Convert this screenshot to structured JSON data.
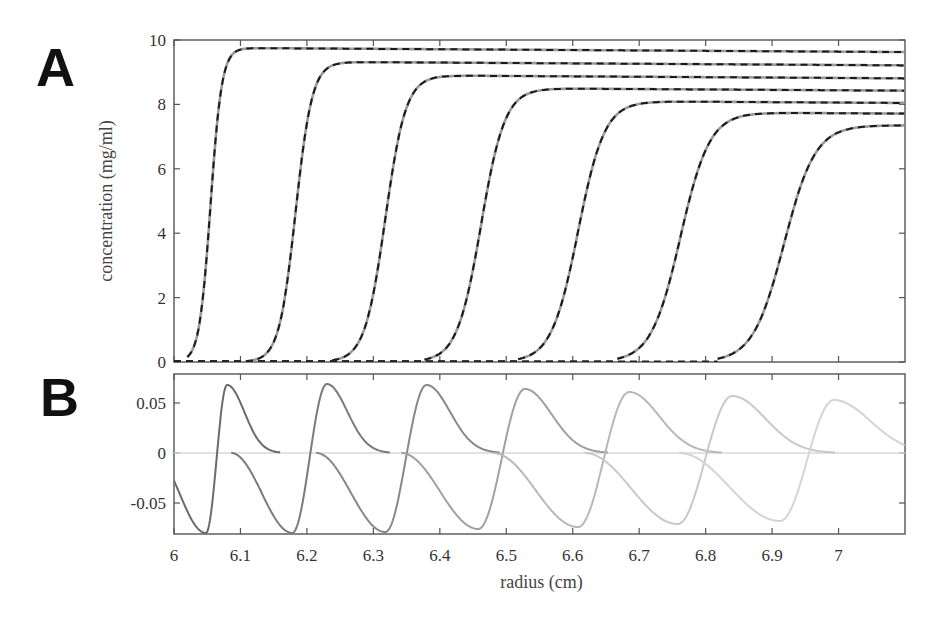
{
  "panels": {
    "A": {
      "letter": "A"
    },
    "B": {
      "letter": "B"
    }
  },
  "chart_data": [
    {
      "id": "A",
      "type": "line",
      "title": "",
      "xlabel": "",
      "ylabel": "concentration (mg/ml)",
      "xlim": [
        6.0,
        7.1
      ],
      "ylim": [
        0,
        10
      ],
      "yticks": [
        0,
        2,
        4,
        6,
        8,
        10
      ],
      "ytick_labels": [
        "0",
        "2",
        "4",
        "6",
        "8",
        "10"
      ],
      "xticks": [
        6.0,
        6.1,
        6.2,
        6.3,
        6.4,
        6.5,
        6.6,
        6.7,
        6.8,
        6.9,
        7.0
      ],
      "grid": false,
      "legend": null,
      "description": "Sedimentation boundary profiles at successive times; solid grey = data, dashed black = fit",
      "series": [
        {
          "name": "scan 1",
          "midpoint": 6.055,
          "width": 0.0085,
          "plateau": 9.75,
          "plateau_slope": -0.05,
          "style": "solid+dashed"
        },
        {
          "name": "scan 2",
          "midpoint": 6.183,
          "width": 0.0125,
          "plateau": 9.32,
          "plateau_slope": -0.05,
          "style": "solid+dashed"
        },
        {
          "name": "scan 3",
          "midpoint": 6.318,
          "width": 0.0155,
          "plateau": 8.9,
          "plateau_slope": -0.05,
          "style": "solid+dashed"
        },
        {
          "name": "scan 4",
          "midpoint": 6.462,
          "width": 0.018,
          "plateau": 8.5,
          "plateau_slope": -0.05,
          "style": "solid+dashed"
        },
        {
          "name": "scan 5",
          "midpoint": 6.608,
          "width": 0.02,
          "plateau": 8.1,
          "plateau_slope": -0.05,
          "style": "solid+dashed"
        },
        {
          "name": "scan 6",
          "midpoint": 6.762,
          "width": 0.022,
          "plateau": 7.75,
          "plateau_slope": -0.05,
          "style": "solid+dashed"
        },
        {
          "name": "scan 7",
          "midpoint": 6.918,
          "width": 0.0235,
          "plateau": 7.35,
          "plateau_slope": 0.0,
          "style": "solid+dashed"
        }
      ]
    },
    {
      "id": "B",
      "type": "line",
      "title": "",
      "xlabel": "radius (cm)",
      "ylabel": "",
      "xlim": [
        6.0,
        7.1
      ],
      "ylim": [
        -0.081,
        0.079
      ],
      "yticks": [
        -0.05,
        0,
        0.05
      ],
      "ytick_labels": [
        "-0.05",
        "0",
        "0.05"
      ],
      "xticks": [
        6.0,
        6.1,
        6.2,
        6.3,
        6.4,
        6.5,
        6.6,
        6.7,
        6.8,
        6.9,
        7.0
      ],
      "xtick_labels": [
        "6",
        "6.1",
        "6.2",
        "6.3",
        "6.4",
        "6.5",
        "6.6",
        "6.7",
        "6.8",
        "6.9",
        "7"
      ],
      "grid": false,
      "legend": null,
      "description": "Residuals of the fit for each scan (progressively lighter grey), oscillating about zero",
      "series": [
        {
          "name": "residual 1",
          "trough_x": 6.048,
          "trough_y": -0.08,
          "peak_x": 6.08,
          "peak_y": 0.068,
          "color": "#6b6b6b"
        },
        {
          "name": "residual 2",
          "trough_x": 6.178,
          "trough_y": -0.08,
          "peak_x": 6.23,
          "peak_y": 0.069,
          "color": "#7a7a7a"
        },
        {
          "name": "residual 3",
          "trough_x": 6.318,
          "trough_y": -0.079,
          "peak_x": 6.38,
          "peak_y": 0.068,
          "color": "#888888"
        },
        {
          "name": "residual 4",
          "trough_x": 6.458,
          "trough_y": -0.076,
          "peak_x": 6.528,
          "peak_y": 0.064,
          "color": "#a0a0a0"
        },
        {
          "name": "residual 5",
          "trough_x": 6.608,
          "trough_y": -0.074,
          "peak_x": 6.685,
          "peak_y": 0.061,
          "color": "#b8b8b8"
        },
        {
          "name": "residual 6",
          "trough_x": 6.758,
          "trough_y": -0.071,
          "peak_x": 6.84,
          "peak_y": 0.057,
          "color": "#c8c8c8"
        },
        {
          "name": "residual 7",
          "trough_x": 6.912,
          "trough_y": -0.068,
          "peak_x": 6.993,
          "peak_y": 0.053,
          "color": "#d4d4d4"
        }
      ],
      "zero_line_color": "#d8d8d8"
    }
  ]
}
